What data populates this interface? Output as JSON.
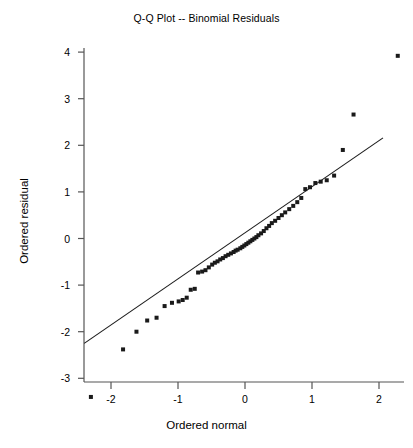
{
  "chart_data": {
    "type": "scatter",
    "title": "Q-Q Plot -- Binomial Residuals",
    "xlabel": "Ordered normal",
    "ylabel": "Ordered residual",
    "xlim": [
      -2.55,
      2.45
    ],
    "ylim": [
      -3.62,
      4.25
    ],
    "grid": false,
    "legend": null,
    "xticks": [
      -2,
      -1,
      0,
      1,
      2
    ],
    "xtick_labels": [
      "-2",
      "-1",
      "0",
      "1",
      "2"
    ],
    "yticks": [
      -3,
      -2,
      -1,
      0,
      1,
      2,
      3,
      4
    ],
    "ytick_labels": [
      "-3",
      "-2",
      "-1",
      "0",
      "1",
      "2",
      "3",
      "4"
    ],
    "marker": "square",
    "marker_color": "#1a1a1a",
    "marker_size": 4,
    "line_color": "#1a1a1a",
    "axis_color": "#555555",
    "reference_line": {
      "x": [
        -2.4,
        2.06
      ],
      "y": [
        -2.25,
        2.16
      ]
    },
    "series": [
      {
        "name": "Ordered residual",
        "x": [
          -2.3,
          -1.82,
          -1.62,
          -1.46,
          -1.32,
          -1.2,
          -1.09,
          -0.99,
          -0.93,
          -0.87,
          -0.81,
          -0.75,
          -0.7,
          -0.64,
          -0.59,
          -0.54,
          -0.49,
          -0.45,
          -0.41,
          -0.37,
          -0.33,
          -0.29,
          -0.25,
          -0.21,
          -0.17,
          -0.14,
          -0.11,
          -0.07,
          -0.04,
          -0.01,
          0.02,
          0.05,
          0.08,
          0.11,
          0.14,
          0.17,
          0.2,
          0.24,
          0.28,
          0.32,
          0.36,
          0.4,
          0.45,
          0.5,
          0.55,
          0.6,
          0.66,
          0.72,
          0.78,
          0.84,
          0.9,
          0.97,
          1.05,
          1.13,
          1.22,
          1.33,
          1.46,
          1.62,
          2.28
        ],
        "y": [
          -3.4,
          -2.38,
          -2.0,
          -1.76,
          -1.7,
          -1.45,
          -1.38,
          -1.35,
          -1.32,
          -1.27,
          -1.1,
          -1.08,
          -0.73,
          -0.71,
          -0.68,
          -0.62,
          -0.56,
          -0.52,
          -0.49,
          -0.45,
          -0.42,
          -0.38,
          -0.35,
          -0.32,
          -0.29,
          -0.26,
          -0.24,
          -0.21,
          -0.18,
          -0.15,
          -0.12,
          -0.09,
          -0.06,
          -0.03,
          0.0,
          0.03,
          0.07,
          0.11,
          0.16,
          0.22,
          0.27,
          0.33,
          0.38,
          0.44,
          0.5,
          0.56,
          0.63,
          0.7,
          0.78,
          0.87,
          1.06,
          1.1,
          1.19,
          1.22,
          1.25,
          1.35,
          1.9,
          2.66,
          3.92
        ]
      }
    ]
  }
}
